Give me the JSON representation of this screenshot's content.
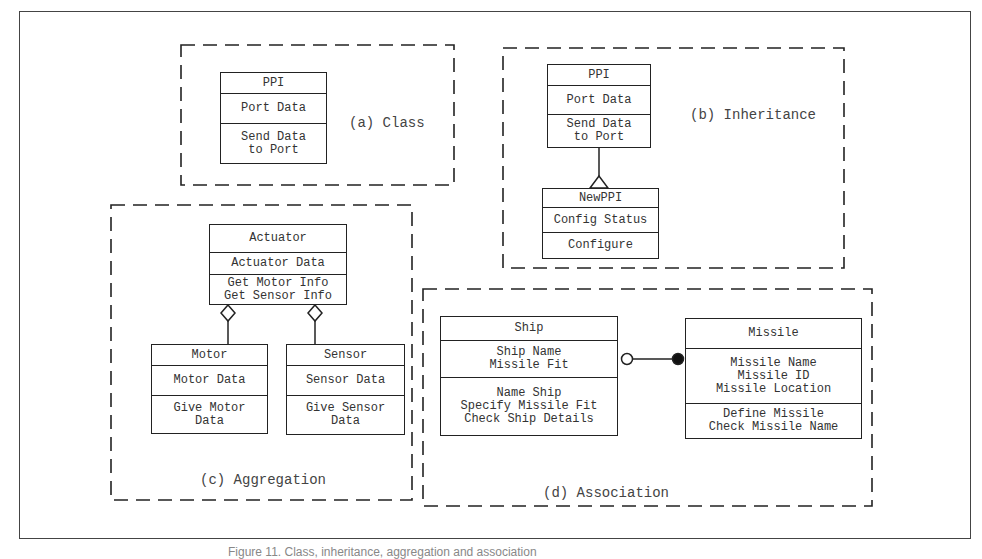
{
  "panels": {
    "class": {
      "label": "(a) Class",
      "box": {
        "name": "PPI",
        "attributes": [
          "Port Data"
        ],
        "operations": [
          "Send Data",
          "to Port"
        ]
      }
    },
    "inheritance": {
      "label": "(b) Inheritance",
      "parent": {
        "name": "PPI",
        "attributes": [
          "Port Data"
        ],
        "operations": [
          "Send Data",
          "to Port"
        ]
      },
      "child": {
        "name": "NewPPI",
        "attributes": [
          "Config Status"
        ],
        "operations": [
          "Configure"
        ]
      },
      "relation": "generalization-triangle"
    },
    "aggregation": {
      "label": "(c) Aggregation",
      "whole": {
        "name": "Actuator",
        "attributes": [
          "Actuator Data"
        ],
        "operations": [
          "Get Motor Info",
          "Get Sensor Info"
        ]
      },
      "parts": [
        {
          "name": "Motor",
          "attributes": [
            "Motor Data"
          ],
          "operations": [
            "Give Motor",
            "Data"
          ]
        },
        {
          "name": "Sensor",
          "attributes": [
            "Sensor Data"
          ],
          "operations": [
            "Give Sensor",
            "Data"
          ]
        }
      ],
      "relation": "aggregation-diamond"
    },
    "association": {
      "label": "(d) Association",
      "left": {
        "name": "Ship",
        "attributes": [
          "Ship Name",
          "Missile Fit"
        ],
        "operations": [
          "Name Ship",
          "Specify Missile Fit",
          "Check Ship Details"
        ]
      },
      "right": {
        "name": "Missile",
        "attributes": [
          "Missile Name",
          "Missile ID",
          "Missile Location"
        ],
        "operations": [
          "Define Missile",
          "Check Missile Name"
        ]
      },
      "relation": "open-circle-to-filled-circle"
    }
  },
  "caption": "Figure 11. Class, inheritance, aggregation and association"
}
